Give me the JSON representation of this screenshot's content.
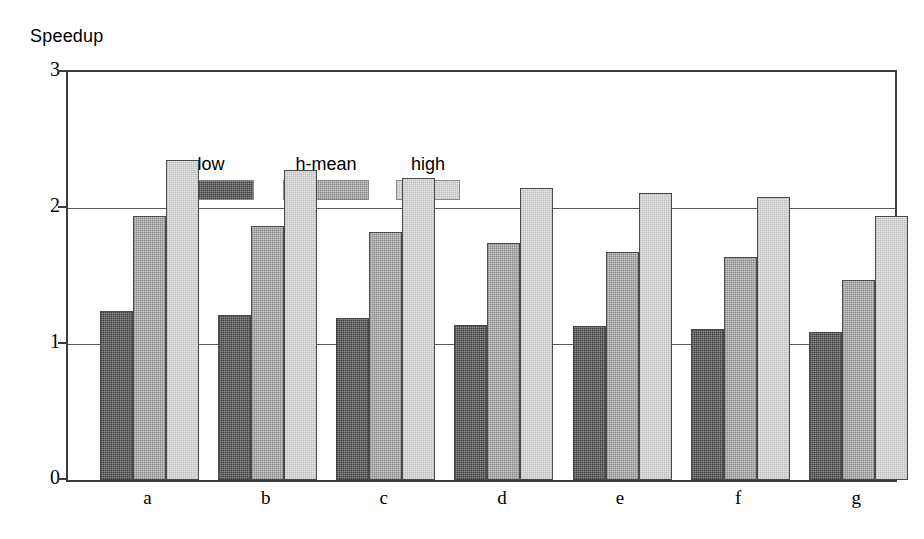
{
  "chart_data": {
    "type": "bar",
    "title": "",
    "ylabel": "Speedup",
    "xlabel": "",
    "ylim": [
      0,
      3
    ],
    "yticks": [
      0,
      1,
      2,
      3
    ],
    "ytick_labels": [
      "0",
      "1",
      "2",
      "3"
    ],
    "grid": "horizontal",
    "legend_position": "top-left inside plot",
    "categories": [
      "a",
      "b",
      "c",
      "d",
      "e",
      "f",
      "g"
    ],
    "series": [
      {
        "name": "low",
        "color": "#8c8c8c",
        "values": [
          1.24,
          1.21,
          1.19,
          1.14,
          1.13,
          1.11,
          1.09
        ]
      },
      {
        "name": "h-mean",
        "color": "#c8c8c8",
        "values": [
          1.94,
          1.87,
          1.82,
          1.74,
          1.68,
          1.64,
          1.47
        ]
      },
      {
        "name": "high",
        "color": "#e6e6e6",
        "values": [
          2.35,
          2.28,
          2.22,
          2.15,
          2.11,
          2.08,
          1.94
        ]
      }
    ]
  },
  "axis": {
    "y_title": "Speedup"
  },
  "legend": {
    "entries": [
      {
        "label": "low"
      },
      {
        "label": "h-mean"
      },
      {
        "label": "high"
      }
    ]
  }
}
